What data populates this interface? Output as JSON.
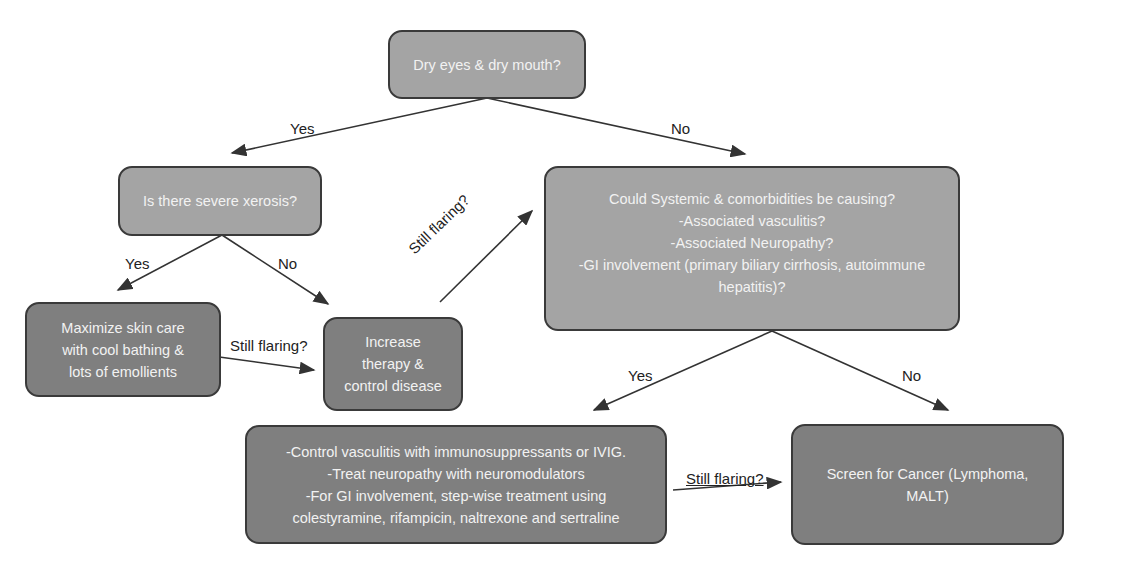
{
  "nodes": {
    "dry_eyes": "Dry eyes & dry mouth?",
    "xerosis": "Is there severe xerosis?",
    "systemic": "Could Systemic & comorbidities be causing?\n-Associated vasculitis?\n-Associated Neuropathy?\n-GI involvement (primary biliary cirrhosis, autoimmune hepatitis)?",
    "skin_care": "Maximize skin care\nwith cool bathing &\nlots of emollients",
    "increase_therapy": "Increase\ntherapy &\ncontrol disease",
    "control_vasculitis": "-Control vasculitis with immunosuppressants or IVIG.\n-Treat neuropathy with neuromodulators\n-For GI involvement, step-wise treatment using\ncolestyramine, rifampicin, naltrexone and sertraline",
    "screen_cancer": "Screen for Cancer (Lymphoma,\nMALT)"
  },
  "edge_labels": {
    "dry_yes": "Yes",
    "dry_no": "No",
    "xerosis_yes": "Yes",
    "xerosis_no": "No",
    "skin_still_flaring": "Still flaring?",
    "increase_still_flaring": "Still flaring?",
    "systemic_yes": "Yes",
    "systemic_no": "No",
    "control_still_flaring": "Still flaring?"
  },
  "caption": "Fig. 1. Management of pruritus in SjS — cropped"
}
